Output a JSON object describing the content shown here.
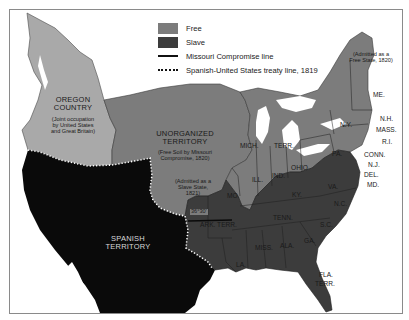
{
  "legend": {
    "items": [
      {
        "label": "Free",
        "type": "swatch",
        "color": "#7c7c7c"
      },
      {
        "label": "Slave",
        "type": "swatch",
        "color": "#3c3c3c"
      },
      {
        "label": "Missouri Compromise line",
        "type": "solid-line",
        "color": "#111111"
      },
      {
        "label": "Spanish-United States treaty  line, 1819",
        "type": "dotted-line",
        "color": "#111111"
      }
    ]
  },
  "colors": {
    "free": "#7c7c7c",
    "slave": "#3c3c3c",
    "oregon": "#a9a9a9",
    "spanish": "#0a0a0a",
    "water": "#ffffff",
    "frame_border": "#8a8a8a"
  },
  "regions": {
    "oregon": {
      "title_line1": "OREGON",
      "title_line2": "COUNTRY",
      "note_line1": "(Joint occupation",
      "note_line2": "by United States",
      "note_line3": "and Great Britain)"
    },
    "unorganized": {
      "title_line1": "UNORGANIZED",
      "title_line2": "TERRITORY",
      "note_line1": "(Free Soil by Missouri",
      "note_line2": "Compromise, 1820)"
    },
    "spanish": {
      "title_line1": "SPANISH",
      "title_line2": "TERRITORY"
    },
    "missouri_note": {
      "line1": "(Admitted as a",
      "line2": "Slave State,",
      "line3": "1821)"
    },
    "maine_note": {
      "line1": "(Admitted as a",
      "line2": "Free State, 1820)"
    },
    "latitude": "36°30'"
  },
  "states": {
    "me": "ME.",
    "nh": "N.H.",
    "mass": "MASS.",
    "ri": "R.I.",
    "conn": "CONN.",
    "nj": "N.J.",
    "del": "DEL.",
    "md": "MD.",
    "ny": "N.Y.",
    "pa": "PA.",
    "ohio": "OHIO",
    "ind": "IND.",
    "ill": "ILL.",
    "mich": "MICH.",
    "terr": "TERR.",
    "mo": "MO.",
    "ky": "KY.",
    "va": "VA.",
    "nc": "N.C.",
    "sc": "S.C.",
    "tenn": "TENN.",
    "ga": "GA.",
    "ala": "ALA.",
    "miss": "MISS.",
    "la": "LA.",
    "ark": "ARK. TERR.",
    "fla": "FLA.",
    "fla_terr": "TERR."
  }
}
